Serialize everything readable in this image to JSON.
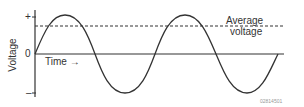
{
  "diagram": {
    "y_axis_label": "Voltage",
    "plus_mark": "+",
    "zero_mark": "0",
    "minus_mark": "–",
    "time_label": "Time →",
    "average_label_line1": "Average",
    "average_label_line2": "voltage",
    "figure_code": "02814501",
    "colors": {
      "line": "#333333",
      "text": "#333333",
      "code": "#999999"
    }
  }
}
